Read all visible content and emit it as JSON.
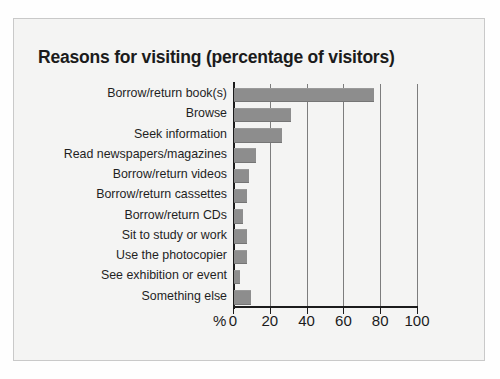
{
  "figure": {
    "title": "Reasons for visiting (percentage of visitors)",
    "percent_symbol": "%",
    "bar_color": "#8d8d8d",
    "axis_color": "#1c1c1c",
    "grid_color": "#7d7d7d",
    "page_background": "#f4f4f3"
  },
  "chart_data": {
    "type": "bar",
    "orientation": "horizontal",
    "title": "Reasons for visiting (percentage of visitors)",
    "xlabel": "%",
    "ylabel": "",
    "xlim": [
      0,
      100
    ],
    "xticks": [
      0,
      20,
      40,
      60,
      80,
      100
    ],
    "xtick_labels": [
      "0",
      "20",
      "40",
      "60",
      "80",
      "100"
    ],
    "grid": true,
    "grid_axis": "x",
    "legend": null,
    "categories": [
      "Borrow/return book(s)",
      "Browse",
      "Seek information",
      "Read newspapers/magazines",
      "Borrow/return videos",
      "Borrow/return cassettes",
      "Borrow/return CDs",
      "Sit to study or work",
      "Use the photocopier",
      "See exhibition or event",
      "Something else"
    ],
    "values": [
      76,
      31,
      26,
      12,
      8,
      7,
      5,
      7,
      7,
      3,
      9
    ]
  }
}
